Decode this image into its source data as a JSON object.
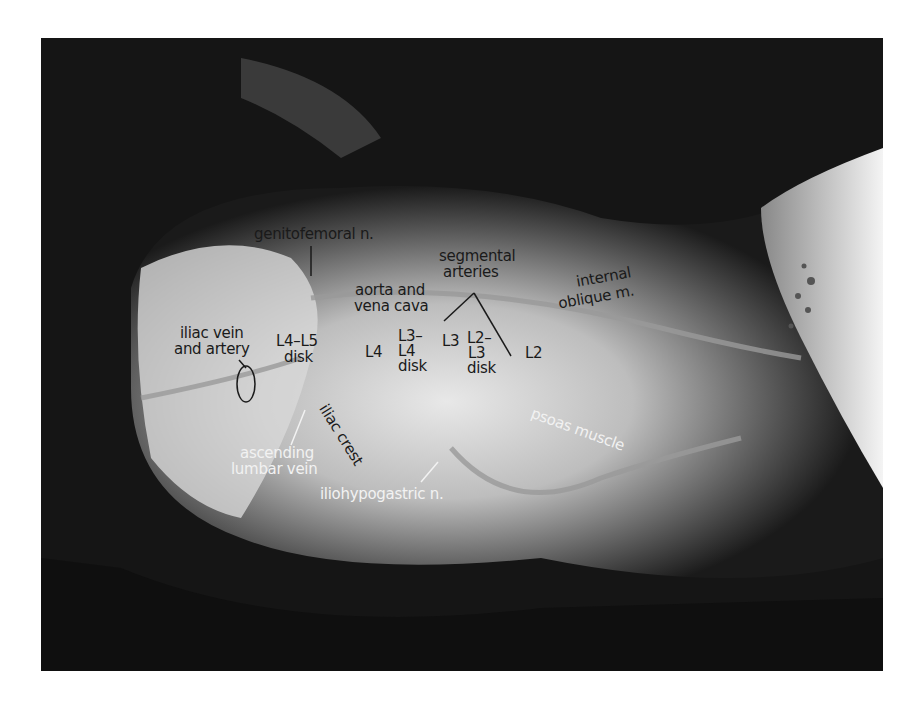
{
  "figure": {
    "colors": {
      "background": "#ffffff",
      "photo_dark": "#141414",
      "label_dark": "#1a1a1a",
      "label_light": "#f2f2f2"
    },
    "labels": {
      "genitofemoral": "genitofemoral n.",
      "segmental_1": "segmental",
      "segmental_2": "arteries",
      "internal_1": "internal",
      "internal_2": "oblique m.",
      "aorta_1": "aorta and",
      "aorta_2": "vena cava",
      "iliac_vein_1": "iliac vein",
      "iliac_vein_2": "and artery",
      "l4l5_1": "L4–L5",
      "l4l5_2": "disk",
      "l4": "L4",
      "l3l4_1": "L3–",
      "l3l4_2": "L4",
      "l3l4_3": "disk",
      "l3": "L3",
      "l2l3_1": "L2–",
      "l2l3_2": "L3",
      "l2l3_3": "disk",
      "l2": "L2",
      "psoas": "psoas muscle",
      "iliac_crest": "iliac crest",
      "asc_lumbar_1": "ascending",
      "asc_lumbar_2": "lumbar vein",
      "iliohypogastric": "iliohypogastric n."
    }
  }
}
